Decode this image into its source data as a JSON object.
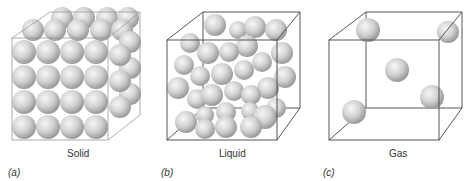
{
  "figure": {
    "panels": [
      {
        "letter": "(a)",
        "label": "Solid",
        "state": "solid"
      },
      {
        "letter": "(b)",
        "label": "Liquid",
        "state": "liquid"
      },
      {
        "letter": "(c)",
        "label": "Gas",
        "state": "gas"
      }
    ]
  },
  "colors": {
    "sphere_light": "#f2f2f2",
    "sphere_dark": "#9e9e9e",
    "edge": "#444444"
  }
}
